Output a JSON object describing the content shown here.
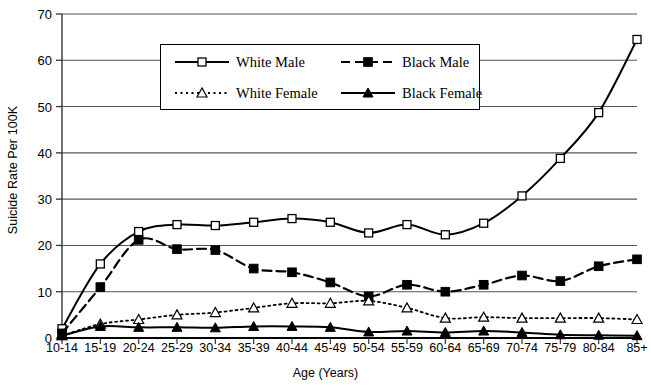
{
  "chart_data": {
    "type": "line",
    "title": "",
    "xlabel": "Age (Years)",
    "ylabel": "Suicide Rate Per 100K",
    "ylim": [
      0,
      70
    ],
    "ytick_values": [
      0,
      10,
      20,
      30,
      40,
      50,
      60,
      70
    ],
    "grid": true,
    "legend_position": "top-center",
    "categories": [
      "10-14",
      "15-19",
      "20-24",
      "25-29",
      "30-34",
      "35-39",
      "40-44",
      "45-49",
      "50-54",
      "55-59",
      "60-64",
      "65-69",
      "70-74",
      "75-79",
      "80-84",
      "85+"
    ],
    "series": [
      {
        "name": "White Male",
        "line_style": "solid",
        "marker": "open-square",
        "values": [
          2.0,
          16.0,
          23.0,
          24.5,
          24.3,
          25.0,
          25.8,
          25.0,
          22.7,
          24.5,
          22.3,
          24.8,
          30.7,
          38.8,
          48.7,
          64.5
        ]
      },
      {
        "name": "Black Male",
        "line_style": "dashed",
        "marker": "filled-square",
        "values": [
          1.0,
          11.0,
          21.2,
          19.2,
          19.0,
          15.0,
          14.2,
          12.0,
          9.0,
          11.5,
          10.0,
          11.5,
          13.5,
          12.3,
          15.5,
          17.0
        ]
      },
      {
        "name": "White Female",
        "line_style": "dotted",
        "marker": "open-triangle",
        "values": [
          0.5,
          3.0,
          4.0,
          5.0,
          5.5,
          6.5,
          7.5,
          7.5,
          8.0,
          6.5,
          4.3,
          4.5,
          4.3,
          4.3,
          4.3,
          4.0
        ]
      },
      {
        "name": "Black Female",
        "line_style": "solid",
        "marker": "filled-triangle",
        "values": [
          0.5,
          2.5,
          2.3,
          2.3,
          2.2,
          2.5,
          2.5,
          2.3,
          1.3,
          1.5,
          1.2,
          1.5,
          1.2,
          0.7,
          0.6,
          0.5
        ]
      }
    ]
  },
  "axes": {
    "y_title": "Suicide Rate Per 100K",
    "x_title": "Age (Years)",
    "y_ticks": [
      "0",
      "10",
      "20",
      "30",
      "40",
      "50",
      "60",
      "70"
    ],
    "x_ticks": [
      "10-14",
      "15-19",
      "20-24",
      "25-29",
      "30-34",
      "35-39",
      "40-44",
      "45-49",
      "50-54",
      "55-59",
      "60-64",
      "65-69",
      "70-74",
      "75-79",
      "80-84",
      "85+"
    ]
  },
  "legend": {
    "entries": [
      {
        "label": "White Male"
      },
      {
        "label": "Black Male"
      },
      {
        "label": "White Female"
      },
      {
        "label": "Black Female"
      }
    ]
  },
  "colors": {
    "line": "#000000",
    "grid": "#555555",
    "background": "#ffffff"
  }
}
